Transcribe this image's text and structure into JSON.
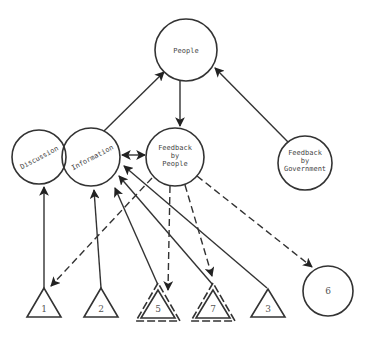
{
  "diagram": {
    "type": "network",
    "nodes": {
      "people": {
        "label": "People",
        "shape": "circle"
      },
      "discussion": {
        "label": "Discussion",
        "shape": "circle"
      },
      "information": {
        "label": "Information",
        "shape": "circle"
      },
      "feedback_people": {
        "line1": "Feedback",
        "line2": "by",
        "line3": "People",
        "shape": "circle"
      },
      "feedback_government": {
        "line1": "Feedback",
        "line2": "by",
        "line3": "Government",
        "shape": "circle"
      },
      "node6": {
        "label": "6",
        "shape": "circle"
      },
      "tri1": {
        "label": "1",
        "shape": "triangle"
      },
      "tri2": {
        "label": "2",
        "shape": "triangle"
      },
      "tri5": {
        "label": "5",
        "shape": "double-dashed-triangle"
      },
      "tri7": {
        "label": "7",
        "shape": "double-dashed-triangle"
      },
      "tri3": {
        "label": "3",
        "shape": "triangle"
      }
    },
    "edges": [
      {
        "from": "Information",
        "to": "People",
        "style": "solid"
      },
      {
        "from": "People",
        "to": "Feedback by People",
        "style": "solid"
      },
      {
        "from": "Feedback by Government",
        "to": "People",
        "style": "solid"
      },
      {
        "from": "Information",
        "to": "Feedback by People",
        "style": "solid",
        "bidirectional": true
      },
      {
        "from": "1",
        "to": "Discussion",
        "style": "solid"
      },
      {
        "from": "2",
        "to": "Information",
        "style": "solid"
      },
      {
        "from": "5",
        "to": "Information",
        "style": "solid"
      },
      {
        "from": "7",
        "to": "Information",
        "style": "solid"
      },
      {
        "from": "3",
        "to": "Information",
        "style": "solid"
      },
      {
        "from": "Feedback by People",
        "to": "1",
        "style": "dashed"
      },
      {
        "from": "Feedback by People",
        "to": "5",
        "style": "dashed"
      },
      {
        "from": "Feedback by People",
        "to": "7",
        "style": "dashed"
      },
      {
        "from": "Feedback by People",
        "to": "6",
        "style": "dashed"
      }
    ]
  }
}
